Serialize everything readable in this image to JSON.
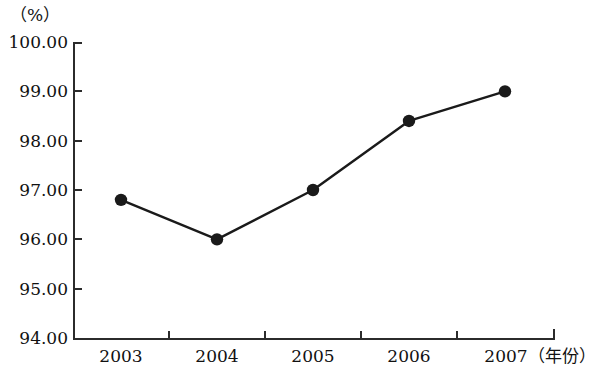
{
  "chart_data": {
    "type": "line",
    "title": "",
    "subtitle": "",
    "xlabel": "年份",
    "ylabel": "%",
    "y_unit_label": "（%）",
    "x_unit_label": "（年份）",
    "categories": [
      "2003",
      "2004",
      "2005",
      "2006",
      "2007"
    ],
    "values": [
      96.8,
      96.0,
      97.0,
      98.4,
      99.0
    ],
    "series": [
      {
        "name": "",
        "values": [
          96.8,
          96.0,
          97.0,
          98.4,
          99.0
        ]
      }
    ],
    "ylim": [
      94.0,
      100.0
    ],
    "ytick_step": 1.0,
    "ytick_labels": [
      "100.00",
      "99.00",
      "98.00",
      "97.00",
      "96.00",
      "95.00",
      "94.00"
    ],
    "ytick_values": [
      100.0,
      99.0,
      98.0,
      97.0,
      96.0,
      95.0,
      94.0
    ],
    "xtick_labels": [
      "2003",
      "2004",
      "2005",
      "2006",
      "2007"
    ],
    "grid": false,
    "legend": false,
    "legend_position": "none",
    "marker": "circle",
    "line_color": "#1a1a1a",
    "marker_color": "#1a1a1a",
    "axis_color": "#2b2b2b",
    "background_color": "#ffffff",
    "text_color": "#111111"
  }
}
